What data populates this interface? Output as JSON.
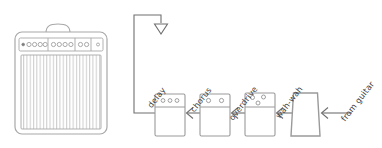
{
  "diagram": {
    "stroke_color": "#9a9a9a",
    "stroke_color_dark": "#7d7d7d",
    "label_color": "#3f3f3f",
    "background": "#ffffff"
  },
  "amplifier": {
    "name": "guitar-amplifier",
    "has_handle": true,
    "control_panel": {
      "groups": [
        {
          "name": "input-group",
          "knob_count": 5,
          "first_knob_small": true
        },
        {
          "name": "tone-group",
          "knob_count": 4
        },
        {
          "name": "master-group",
          "knob_count": 2
        }
      ],
      "indicator": {
        "name": "power-indicator",
        "count": 1
      }
    },
    "grille": {
      "stripe_count": 28
    }
  },
  "pedals": [
    {
      "id": "delay",
      "label": "delay",
      "knob_count": 3,
      "knob_layout": "row",
      "shape": "rect"
    },
    {
      "id": "chorus",
      "label": "chorus",
      "knob_count": 2,
      "knob_layout": "row",
      "shape": "rect"
    },
    {
      "id": "overdrive",
      "label": "overdrive",
      "knob_count": 3,
      "knob_layout": "triangle",
      "shape": "rect"
    },
    {
      "id": "wah-wah",
      "label": "wah-wah",
      "knob_count": 0,
      "knob_layout": "none",
      "shape": "trapezoid"
    }
  ],
  "connections": [
    {
      "id": "guitar-to-wah",
      "label": "from guitar",
      "direction": "left"
    },
    {
      "id": "wah-to-overdrive",
      "label": "",
      "direction": "left"
    },
    {
      "id": "overdrive-to-chorus",
      "label": "",
      "direction": "left"
    },
    {
      "id": "chorus-to-delay",
      "label": "",
      "direction": "left"
    },
    {
      "id": "delay-to-amp",
      "label": "",
      "direction": "down"
    }
  ],
  "labels": {
    "delay": "delay",
    "chorus": "chorus",
    "overdrive": "overdrive",
    "wah_wah": "wah-wah",
    "from_guitar": "from guitar"
  }
}
